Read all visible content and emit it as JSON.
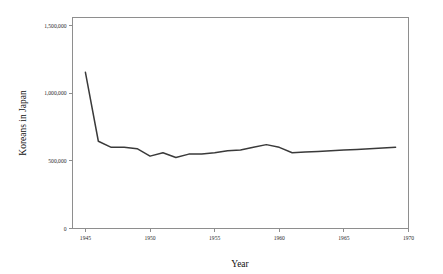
{
  "chart_data": {
    "type": "line",
    "title": "",
    "xlabel": "Year",
    "ylabel": "Koreans in Japan",
    "xlim": [
      1944,
      1970
    ],
    "ylim": [
      0,
      1560000
    ],
    "grid": false,
    "legend": "none",
    "line_color": "#3a3a3a",
    "axis_color": "#8e8e8e",
    "x_ticks": [
      "1945",
      "1950",
      "1955",
      "1960",
      "1965",
      "1970"
    ],
    "x_tick_values": [
      1945,
      1950,
      1955,
      1960,
      1965,
      1970
    ],
    "y_ticks": [
      "0",
      "500,000",
      "1,000,000",
      "1,500,000"
    ],
    "y_tick_values": [
      0,
      500000,
      1000000,
      1500000
    ],
    "series": [
      {
        "name": "Koreans in Japan",
        "x": [
          1945,
          1946,
          1947,
          1948,
          1949,
          1950,
          1951,
          1952,
          1953,
          1954,
          1955,
          1956,
          1957,
          1958,
          1959,
          1960,
          1961,
          1962,
          1963,
          1964,
          1965,
          1966,
          1967,
          1968,
          1969
        ],
        "values": [
          1155000,
          645000,
          600000,
          600000,
          590000,
          535000,
          560000,
          525000,
          550000,
          550000,
          560000,
          575000,
          580000,
          600000,
          620000,
          600000,
          560000,
          565000,
          570000,
          575000,
          580000,
          585000,
          590000,
          595000,
          600000
        ]
      }
    ]
  },
  "figure": {
    "x_axis_title": "Year",
    "y_axis_title": "Koreans in Japan"
  }
}
